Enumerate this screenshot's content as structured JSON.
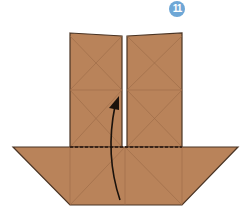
{
  "step": {
    "number": "11",
    "badge_color": "#6ea7d6"
  },
  "colors": {
    "paper": "#b9835a",
    "paper_edge": "#4a3424",
    "crease": "#9a6a46",
    "arrow": "#1a120c",
    "background": "#ffffff"
  },
  "diagram": {
    "elements": [
      "left-upper-flap",
      "right-upper-flap",
      "lower-trapezoid",
      "valley-fold-dashed-line",
      "fold-up-arrow"
    ]
  }
}
